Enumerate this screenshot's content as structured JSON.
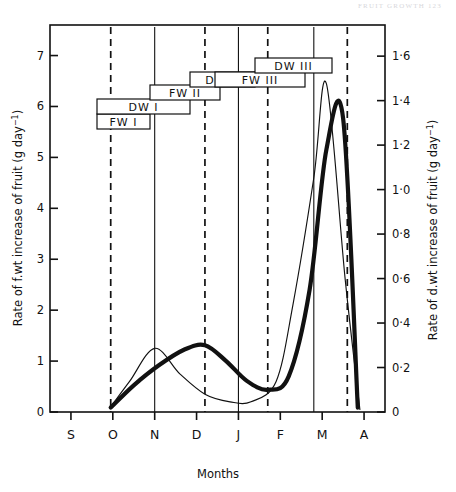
{
  "header": {
    "running_head": "FRUIT GROWTH    123"
  },
  "axes": {
    "left_title": "Rate of f.wt increase of fruit (g day",
    "left_title_exp": "−1",
    "left_title_close": ")",
    "right_title": "Rate of d.wt increase of fruit (g day",
    "right_title_exp": "−1",
    "right_title_close": ")",
    "x_title": "Months",
    "left_ticks": [
      "0",
      "1",
      "2",
      "3",
      "4",
      "5",
      "6",
      "7"
    ],
    "right_ticks": [
      "0",
      "0·2",
      "0·4",
      "0·6",
      "0·8",
      "1·0",
      "1·2",
      "1·4",
      "1·6"
    ],
    "x_ticks": [
      "S",
      "O",
      "N",
      "D",
      "J",
      "F",
      "M",
      "A"
    ]
  },
  "stage_labels": [
    {
      "text": "FW I",
      "x": 97,
      "w": 53,
      "y": 114
    },
    {
      "text": "DW I",
      "x": 97,
      "w": 93,
      "y": 99
    },
    {
      "text": "FW II",
      "x": 150,
      "w": 70,
      "y": 85
    },
    {
      "text": "DW II",
      "x": 190,
      "w": 65,
      "y": 72
    },
    {
      "text": "FW III",
      "x": 215,
      "w": 90,
      "y": 72
    },
    {
      "text": "DW III",
      "x": 255,
      "w": 77,
      "y": 58
    }
  ],
  "chart_data": {
    "type": "line",
    "title": "",
    "xlabel": "Months",
    "ylabel": "Rate of f.wt increase of fruit (g day-1)",
    "y2label": "Rate of d.wt increase of fruit (g day-1)",
    "xlim_months": [
      "S",
      "A"
    ],
    "ylim": [
      0,
      7.6
    ],
    "y2lim": [
      0,
      1.74
    ],
    "grid": false,
    "legend": "none",
    "x_tick_labels": [
      "S",
      "O",
      "N",
      "D",
      "J",
      "F",
      "M",
      "A"
    ],
    "y_tick_values": [
      0,
      1,
      2,
      3,
      4,
      5,
      6,
      7
    ],
    "y2_tick_values": [
      0,
      0.2,
      0.4,
      0.6,
      0.8,
      1.0,
      1.2,
      1.4,
      1.6
    ],
    "vertical_markers": [
      {
        "month_pos": 0.95,
        "style": "dashed"
      },
      {
        "month_pos": 2.0,
        "style": "solid"
      },
      {
        "month_pos": 3.2,
        "style": "dashed"
      },
      {
        "month_pos": 4.0,
        "style": "solid"
      },
      {
        "month_pos": 4.7,
        "style": "dashed"
      },
      {
        "month_pos": 5.8,
        "style": "solid"
      },
      {
        "month_pos": 6.6,
        "style": "dashed"
      }
    ],
    "series": [
      {
        "name": "Rate of f.wt increase (thin line, left axis)",
        "axis": "left",
        "style": "thin",
        "x_months": [
          "O",
          "O+",
          "N",
          "N+",
          "D",
          "D+",
          "J",
          "J+",
          "F",
          "F-peak",
          "F+",
          "M",
          "M+"
        ],
        "x": [
          0.95,
          1.4,
          2.0,
          2.6,
          3.2,
          3.8,
          4.3,
          4.9,
          5.3,
          5.8,
          6.1,
          6.55,
          6.9
        ],
        "values": [
          0.1,
          0.6,
          1.25,
          0.75,
          0.35,
          0.2,
          0.2,
          0.6,
          2.1,
          4.6,
          6.45,
          2.6,
          0.05
        ]
      },
      {
        "name": "Rate of d.wt increase (thick line, right axis)",
        "axis": "right",
        "style": "thick",
        "x_months": [
          "O",
          "O+",
          "N",
          "N+",
          "D",
          "D+",
          "J",
          "J+",
          "F",
          "F+",
          "M",
          "M+",
          "M++"
        ],
        "x": [
          0.95,
          1.5,
          2.1,
          2.7,
          3.2,
          3.7,
          4.2,
          4.7,
          5.2,
          5.7,
          6.1,
          6.5,
          6.85
        ],
        "values": [
          0.02,
          0.12,
          0.21,
          0.28,
          0.3,
          0.23,
          0.14,
          0.1,
          0.16,
          0.55,
          1.18,
          1.32,
          0.02
        ]
      }
    ]
  }
}
